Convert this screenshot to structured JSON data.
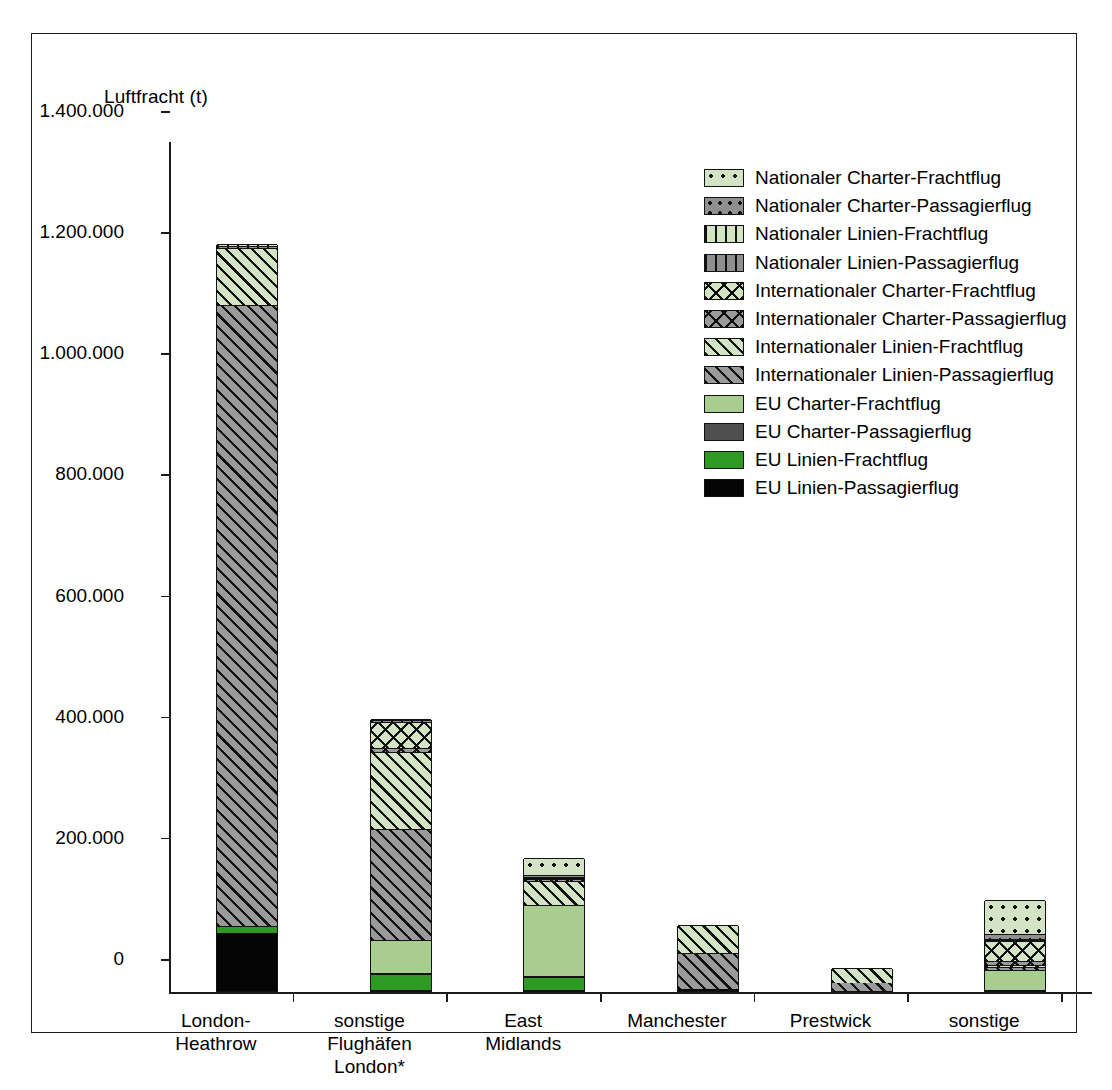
{
  "chart_data": {
    "type": "bar",
    "stacked": true,
    "title": "",
    "ylabel": "Luftfracht (t)",
    "xlabel": "",
    "ylim": [
      0,
      1400000
    ],
    "ytick_labels": [
      "1.400.000",
      "1.200.000",
      "1.000.000",
      "800.000",
      "600.000",
      "400.000",
      "200.000",
      "0"
    ],
    "ytick_values": [
      1400000,
      1200000,
      1000000,
      800000,
      600000,
      400000,
      200000,
      0
    ],
    "grid": false,
    "legend_position": "upper-right inside plot",
    "categories": [
      "London-\nHeathrow",
      "sonstige\nFlughäfen\nLondon*",
      "East\nMidlands",
      "Manchester",
      "Prestwick",
      "sonstige"
    ],
    "series": [
      {
        "name": "EU Linien-Passagierflug",
        "pattern": "solid-black",
        "values": [
          96000,
          2000,
          1000,
          3000,
          0,
          1000
        ]
      },
      {
        "name": "EU Linien-Frachtflug",
        "pattern": "solid-green",
        "values": [
          11000,
          26000,
          22000,
          0,
          0,
          0
        ]
      },
      {
        "name": "EU Charter-Passagierflug",
        "pattern": "solid-dark-gray",
        "values": [
          0,
          1000,
          1000,
          0,
          0,
          1000
        ]
      },
      {
        "name": "EU Charter-Frachtflug",
        "pattern": "solid-light-green",
        "values": [
          0,
          56000,
          118000,
          0,
          0,
          32000
        ]
      },
      {
        "name": "Internationaler Linien-Passagierflug",
        "pattern": "diagonal-gray",
        "values": [
          1026000,
          183000,
          0,
          59000,
          13000,
          6000
        ]
      },
      {
        "name": "Internationaler Linien-Frachtflug",
        "pattern": "diagonal-light-green",
        "values": [
          94000,
          126000,
          40000,
          47000,
          25000,
          3000
        ]
      },
      {
        "name": "Internationaler Charter-Passagierflug",
        "pattern": "cross-gray",
        "values": [
          0,
          8000,
          3000,
          0,
          0,
          7000
        ]
      },
      {
        "name": "Internationaler Charter-Frachtflug",
        "pattern": "cross-light-green",
        "values": [
          0,
          42000,
          2000,
          0,
          0,
          33000
        ]
      },
      {
        "name": "Nationaler Linien-Passagierflug",
        "pattern": "vertical-gray",
        "values": [
          3000,
          3000,
          1000,
          0,
          0,
          1000
        ]
      },
      {
        "name": "Nationaler Linien-Frachtflug",
        "pattern": "vertical-light-green",
        "values": [
          3000,
          2000,
          1000,
          0,
          0,
          2000
        ]
      },
      {
        "name": "Nationaler Charter-Passagierflug",
        "pattern": "dot-gray",
        "values": [
          0,
          0,
          2000,
          0,
          0,
          8000
        ]
      },
      {
        "name": "Nationaler Charter-Frachtflug",
        "pattern": "dot-light-green",
        "values": [
          0,
          0,
          28000,
          0,
          0,
          56000
        ]
      }
    ],
    "totals": [
      1233000,
      449000,
      219000,
      109000,
      38000,
      150000
    ],
    "colors": {
      "black": "#050505",
      "green": "#2e9a24",
      "light_green": "#a9cd8e",
      "dark_gray": "#4f4f4f",
      "hatch_gray": "#9a9a9a",
      "hatch_light_green": "#d3e4c4",
      "axis": "#1a1a1a"
    }
  },
  "legend": {
    "items": [
      {
        "label": "Nationaler Charter-Frachtflug",
        "swatch": "dot-light-green"
      },
      {
        "label": "Nationaler Charter-Passagierflug",
        "swatch": "dot-gray"
      },
      {
        "label": "Nationaler Linien-Frachtflug",
        "swatch": "vertical-light-green"
      },
      {
        "label": "Nationaler Linien-Passagierflug",
        "swatch": "vertical-gray"
      },
      {
        "label": "Internationaler Charter-Frachtflug",
        "swatch": "cross-light-green"
      },
      {
        "label": "Internationaler Charter-Passagierflug",
        "swatch": "cross-gray"
      },
      {
        "label": "Internationaler Linien-Frachtflug",
        "swatch": "diagonal-light-green"
      },
      {
        "label": "Internationaler Linien-Passagierflug",
        "swatch": "diagonal-gray"
      },
      {
        "label": "EU Charter-Frachtflug",
        "swatch": "solid-light-green"
      },
      {
        "label": "EU Charter-Passagierflug",
        "swatch": "solid-dark-gray"
      },
      {
        "label": "EU Linien-Frachtflug",
        "swatch": "solid-green"
      },
      {
        "label": "EU Linien-Passagierflug",
        "swatch": "solid-black"
      }
    ]
  }
}
